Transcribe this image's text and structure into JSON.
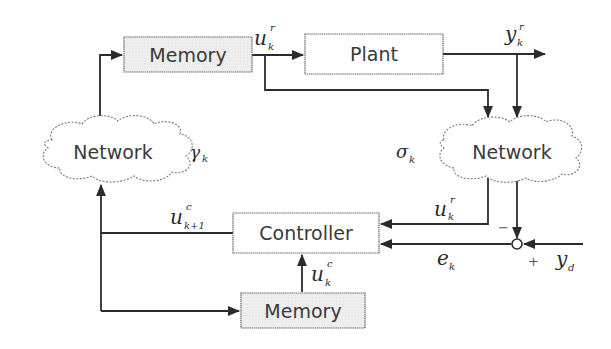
{
  "diagram": {
    "type": "networked-control-block-diagram",
    "blocks": {
      "memory_top": {
        "label": "Memory"
      },
      "plant": {
        "label": "Plant"
      },
      "controller": {
        "label": "Controller"
      },
      "memory_bottom": {
        "label": "Memory"
      }
    },
    "clouds": {
      "network_left": {
        "label": "Network",
        "param_symbol": "γ",
        "param_sub": "k"
      },
      "network_right": {
        "label": "Network",
        "param_symbol": "σ",
        "param_sub": "k"
      }
    },
    "signals": {
      "u_r_top": {
        "base": "u",
        "sup": "r",
        "sub": "k"
      },
      "y_r": {
        "base": "y",
        "sup": "r",
        "sub": "k"
      },
      "u_r_right": {
        "base": "u",
        "sup": "r",
        "sub": "k"
      },
      "u_c_next": {
        "base": "u",
        "sup": "c",
        "sub": "k+1"
      },
      "u_c": {
        "base": "u",
        "sup": "c",
        "sub": "k"
      },
      "e_k": {
        "base": "e",
        "sub": "k"
      },
      "y_d": {
        "base": "y",
        "sub": "d"
      }
    },
    "summing_junction": {
      "minus_sign": "−",
      "plus_sign": "+"
    },
    "colors": {
      "line": "#2b2b2b",
      "block_fill_memory": "#ececec",
      "block_fill_default": "#ffffff",
      "border": "#6a6a6a"
    }
  }
}
